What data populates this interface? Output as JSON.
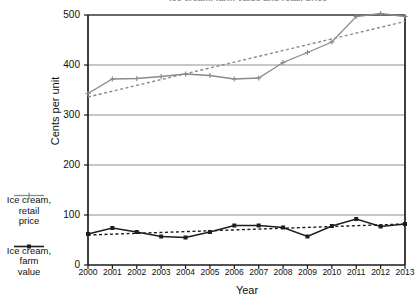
{
  "chart_data": {
    "type": "line",
    "title": "Ice cream, farm value and retail price",
    "xlabel": "Year",
    "ylabel": "Cents per unit",
    "categories": [
      "2000",
      "2001",
      "2002",
      "2003",
      "2004",
      "2005",
      "2006",
      "2007",
      "2008",
      "2009",
      "2010",
      "2011",
      "2012",
      "2013"
    ],
    "x": [
      2000,
      2001,
      2002,
      2003,
      2004,
      2005,
      2006,
      2007,
      2008,
      2009,
      2010,
      2011,
      2012,
      2013
    ],
    "xlim": [
      2000,
      2013
    ],
    "ylim": [
      0,
      500
    ],
    "yticks": [
      0,
      100,
      200,
      300,
      400,
      500
    ],
    "grid": true,
    "legend_position": "left",
    "series": [
      {
        "name": "Ice cream, retail price",
        "color": "#8a8a8a",
        "marker": "plus",
        "values": [
          343,
          372,
          373,
          377,
          382,
          379,
          372,
          374,
          405,
          425,
          446,
          497,
          503,
          497
        ]
      },
      {
        "name": "Ice cream, farm value",
        "color": "#1d1d1d",
        "marker": "square",
        "values": [
          62,
          74,
          66,
          57,
          55,
          66,
          79,
          79,
          75,
          57,
          78,
          92,
          77,
          82
        ]
      }
    ],
    "trendlines": [
      {
        "name": "Ice cream, retail price trend",
        "style": "dashed",
        "color": "#8a8a8a",
        "start": 336,
        "end": 487
      },
      {
        "name": "Ice cream, farm value trend",
        "style": "dashed",
        "color": "#1d1d1d",
        "start": 60,
        "end": 82
      }
    ]
  },
  "legend": {
    "items": [
      {
        "label_line1": "Ice cream,",
        "label_line2": "retail",
        "label_line3": "price",
        "color": "#8a8a8a",
        "marker": "plus"
      },
      {
        "label_line1": "Ice cream,",
        "label_line2": "farm",
        "label_line3": "value",
        "color": "#1d1d1d",
        "marker": "square"
      }
    ]
  }
}
